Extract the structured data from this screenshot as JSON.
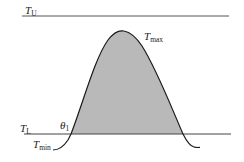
{
  "diagram": {
    "colors": {
      "line": "#444444",
      "curve": "#1a1a1a",
      "shade": "#b9b9b9",
      "text": "#222222"
    },
    "labels": {
      "upper_threshold": {
        "main": "T",
        "sub": "U"
      },
      "maximum": {
        "main": "T",
        "sub": "max"
      },
      "lower_threshold": {
        "main": "T",
        "sub": "L"
      },
      "theta": {
        "main": "θ",
        "sub": "1"
      },
      "minimum": {
        "main": "T",
        "sub": "min"
      }
    }
  }
}
